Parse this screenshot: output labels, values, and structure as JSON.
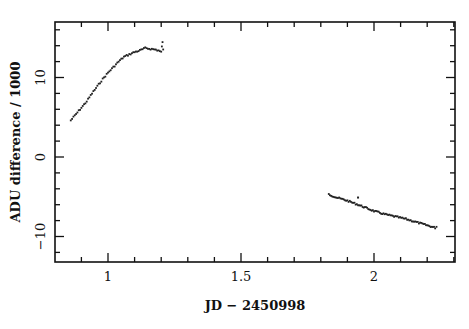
{
  "chart_data": {
    "type": "scatter",
    "title": "",
    "xlabel": "JD − 2450998",
    "ylabel": "ADU difference / 1000",
    "xlim": [
      0.8,
      2.31
    ],
    "ylim": [
      -13.2,
      17.0
    ],
    "xticks_major": [
      1,
      1.5,
      2
    ],
    "xtick_labels": [
      "1",
      "1.5",
      "2"
    ],
    "xticks_minor_step": 0.1,
    "yticks_major": [
      -10,
      0,
      10
    ],
    "ytick_labels": [
      "−10",
      "0",
      "10"
    ],
    "yticks_minor_step": 2,
    "grid": false,
    "legend": null,
    "series": [
      {
        "name": "segment-1",
        "x": [
          0.86,
          0.88,
          0.9,
          0.92,
          0.94,
          0.96,
          0.98,
          1.0,
          1.02,
          1.04,
          1.06,
          1.08,
          1.1,
          1.12,
          1.14,
          1.16,
          1.18,
          1.19,
          1.2,
          1.205,
          1.21
        ],
        "y": [
          4.6,
          5.4,
          6.2,
          7.0,
          8.0,
          8.9,
          9.8,
          10.6,
          11.3,
          12.0,
          12.6,
          12.9,
          13.2,
          13.4,
          13.7,
          13.6,
          13.5,
          13.4,
          13.2,
          14.5,
          12.4
        ]
      },
      {
        "name": "segment-2",
        "x": [
          1.83,
          1.86,
          1.9,
          1.94,
          1.97,
          2.0,
          2.04,
          2.08,
          2.12,
          2.16,
          2.2,
          2.23,
          2.24
        ],
        "y": [
          -4.7,
          -5.1,
          -5.5,
          -6.0,
          -6.4,
          -6.8,
          -7.2,
          -7.5,
          -7.8,
          -8.2,
          -8.6,
          -8.9,
          -8.6
        ]
      }
    ],
    "outliers": [
      {
        "x": 1.94,
        "y": -5.1
      }
    ],
    "marker_color": "#222222"
  }
}
